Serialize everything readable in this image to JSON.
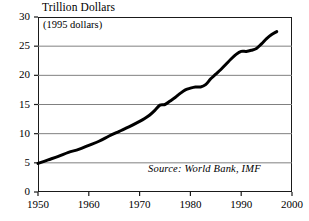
{
  "chart_data": {
    "type": "line",
    "title": "Trillion Dollars",
    "subtitle": "(1995 dollars)",
    "source_note": "Source: World Bank, IMF",
    "xlabel": "",
    "ylabel": "Trillion Dollars",
    "xlim": [
      1950,
      2000
    ],
    "ylim": [
      0,
      30
    ],
    "xticks": [
      1950,
      1960,
      1970,
      1980,
      1990,
      2000
    ],
    "xtick_labels": [
      "1950",
      "1960",
      "1970",
      "1980",
      "1990",
      "2000"
    ],
    "yticks": [
      0,
      5,
      10,
      15,
      20,
      25,
      30
    ],
    "ytick_labels": [
      "0",
      "5",
      "10",
      "15",
      "20",
      "25",
      "30"
    ],
    "grid": "horizontal",
    "legend": "none",
    "line_color": "#000000",
    "grid_color": "#808080",
    "frame_color": "#1a1a1a",
    "series": [
      {
        "name": "Gross World Product",
        "x": [
          1950,
          1952,
          1954,
          1956,
          1958,
          1960,
          1962,
          1964,
          1966,
          1968,
          1970,
          1971,
          1972,
          1973,
          1974,
          1975,
          1976,
          1977,
          1978,
          1979,
          1980,
          1981,
          1982,
          1983,
          1984,
          1985,
          1986,
          1987,
          1988,
          1989,
          1990,
          1991,
          1992,
          1993,
          1994,
          1995,
          1996,
          1997
        ],
        "values": [
          4.9,
          5.5,
          6.1,
          6.8,
          7.3,
          8.0,
          8.7,
          9.6,
          10.4,
          11.2,
          12.1,
          12.6,
          13.2,
          14.0,
          14.9,
          15.0,
          15.6,
          16.2,
          16.9,
          17.5,
          17.8,
          18.0,
          18.0,
          18.4,
          19.4,
          20.2,
          21.0,
          21.9,
          22.8,
          23.6,
          24.1,
          24.1,
          24.3,
          24.6,
          25.4,
          26.3,
          27.0,
          27.5
        ]
      }
    ]
  }
}
